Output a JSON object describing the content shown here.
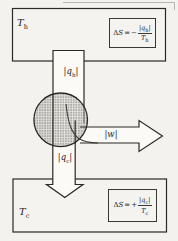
{
  "figure": {
    "hot_reservoir": {
      "label": {
        "base": "T",
        "sub": "h"
      },
      "equation": {
        "delta": "Δ",
        "entropy": "S",
        "equals": "=",
        "sign": "−",
        "numerator": {
          "open": "|",
          "base": "q",
          "sub": "h",
          "close": "|"
        },
        "denominator": {
          "base": "T",
          "sub": "h"
        }
      }
    },
    "cold_reservoir": {
      "label": {
        "base": "T",
        "sub": "c"
      },
      "equation": {
        "delta": "Δ",
        "entropy": "S",
        "equals": "=",
        "sign": "+",
        "numerator": {
          "open": "|",
          "base": "q",
          "sub": "c",
          "close": "|"
        },
        "denominator": {
          "base": "T",
          "sub": "c"
        }
      }
    },
    "flows": {
      "heat_from_hot": {
        "open": "|",
        "base": "q",
        "sub": "h",
        "close": "|"
      },
      "heat_to_cold": {
        "open": "|",
        "base": "q",
        "sub": "c",
        "close": "|"
      },
      "work": {
        "open": "|",
        "base": "w",
        "close": "|"
      }
    }
  },
  "colors": {
    "ink": "#2b2926",
    "paper": "#f3f2ee",
    "duct_fill": "#fbfaf7",
    "engine_stipple": "#c9c7c2"
  }
}
